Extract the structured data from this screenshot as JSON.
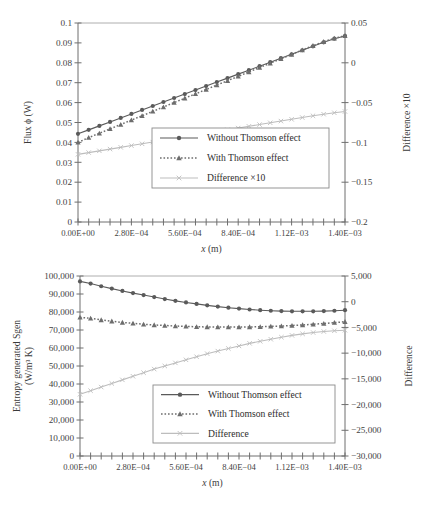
{
  "figure": {
    "background": "#ffffff",
    "colors": {
      "series_without": "#5a5a5a",
      "series_with": "#6d6d6d",
      "series_difference": "#bdbdbd",
      "axis": "#6e6e6e",
      "text": "#3a3a3a"
    }
  },
  "charts": [
    {
      "id": "chart-top",
      "chart_data": {
        "type": "line",
        "title": "",
        "xlabel": "x (m)",
        "ylabel": "Flux ϕ (W)",
        "y2label": "Difference ×10",
        "xlim": [
          0,
          0.0014
        ],
        "ylim": [
          0,
          0.1
        ],
        "y2lim": [
          -0.2,
          0.05
        ],
        "grid": false,
        "legend_position": "center",
        "xticks": [
          0,
          0.00028,
          0.00056,
          0.00084,
          0.00112,
          0.0014
        ],
        "xticklabels": [
          "0.00E+00",
          "2.80E−04",
          "5.60E−04",
          "8.40E−04",
          "1.12E−03",
          "1.40E−03"
        ],
        "xminor_count": 25,
        "yticks": [
          0,
          0.01,
          0.02,
          0.03,
          0.04,
          0.05,
          0.06,
          0.07,
          0.08,
          0.09,
          0.1
        ],
        "yticklabels": [
          "0",
          "0.01",
          "0.02",
          "0.03",
          "0.04",
          "0.05",
          "0.06",
          "0.07",
          "0.08",
          "0.09",
          "0.1"
        ],
        "y2ticks": [
          -0.2,
          -0.15,
          -0.1,
          -0.05,
          0,
          0.05
        ],
        "y2ticklabels": [
          "−0.2",
          "−0.15",
          "−0.1",
          "−0.05",
          "0",
          "0.05"
        ],
        "x": [
          0.0,
          5.6e-05,
          0.000112,
          0.000168,
          0.000224,
          0.00028,
          0.000336,
          0.000392,
          0.000448,
          0.000504,
          0.00056,
          0.000616,
          0.000672,
          0.000728,
          0.000784,
          0.00084,
          0.000896,
          0.000952,
          0.001008,
          0.001064,
          0.00112,
          0.001176,
          0.001232,
          0.001288,
          0.001344,
          0.0014
        ],
        "series": [
          {
            "name": "Without Thomson effect",
            "axis": "left",
            "marker": "circle",
            "linestyle": "solid",
            "color": "#5a5a5a",
            "values": [
              0.0443,
              0.0463,
              0.0483,
              0.0503,
              0.0523,
              0.0543,
              0.0563,
              0.0583,
              0.0603,
              0.0623,
              0.0643,
              0.0663,
              0.0683,
              0.0703,
              0.0723,
              0.0743,
              0.0763,
              0.0783,
              0.0803,
              0.0823,
              0.0843,
              0.0863,
              0.0883,
              0.0903,
              0.0921,
              0.0935
            ]
          },
          {
            "name": "With Thomson effect",
            "axis": "left",
            "marker": "triangle",
            "linestyle": "dotted",
            "color": "#6d6d6d",
            "values": [
              0.04,
              0.0424,
              0.0446,
              0.0468,
              0.049,
              0.0512,
              0.0534,
              0.0556,
              0.0578,
              0.06,
              0.0622,
              0.0644,
              0.0666,
              0.0688,
              0.071,
              0.0732,
              0.0754,
              0.0776,
              0.0798,
              0.082,
              0.0842,
              0.0864,
              0.0886,
              0.0906,
              0.0923,
              0.0936
            ]
          },
          {
            "name": "Difference ×10",
            "axis": "right",
            "marker": "cross",
            "linestyle": "solid",
            "color": "#bdbdbd",
            "values": [
              -0.115,
              -0.1128,
              -0.1106,
              -0.1084,
              -0.1062,
              -0.104,
              -0.1018,
              -0.0996,
              -0.0974,
              -0.0952,
              -0.093,
              -0.0908,
              -0.0886,
              -0.0864,
              -0.0842,
              -0.082,
              -0.0798,
              -0.0776,
              -0.0754,
              -0.0732,
              -0.071,
              -0.0688,
              -0.0666,
              -0.0646,
              -0.0628,
              -0.0612
            ]
          }
        ],
        "legend": [
          {
            "label": "Without Thomson effect",
            "marker": "circle",
            "linestyle": "solid",
            "color": "#5a5a5a"
          },
          {
            "label": "With Thomson effect",
            "marker": "triangle",
            "linestyle": "dotted",
            "color": "#6d6d6d"
          },
          {
            "label": "Difference ×10",
            "marker": "cross",
            "linestyle": "solid",
            "color": "#bdbdbd"
          }
        ]
      }
    },
    {
      "id": "chart-bottom",
      "chart_data": {
        "type": "line",
        "title": "",
        "xlabel": "x (m)",
        "ylabel": "Entropy generated Sgen",
        "ylabel2": "(W/m³ K)",
        "y2label": "Difference",
        "xlim": [
          0,
          0.0014
        ],
        "ylim": [
          0,
          100000
        ],
        "y2lim": [
          -30000,
          5000
        ],
        "grid": false,
        "legend_position": "center",
        "xticks": [
          0,
          0.00028,
          0.00056,
          0.00084,
          0.00112,
          0.0014
        ],
        "xticklabels": [
          "0.00E+00",
          "2.80E−04",
          "5.60E−04",
          "8.40E−04",
          "1.12E−03",
          "1.40E−03"
        ],
        "xminor_count": 25,
        "yticks": [
          0,
          10000,
          20000,
          30000,
          40000,
          50000,
          60000,
          70000,
          80000,
          90000,
          100000
        ],
        "yticklabels": [
          "0",
          "10,000",
          "20,000",
          "30,000",
          "40,000",
          "50,000",
          "60,000",
          "70,000",
          "80,000",
          "90,000",
          "100,000"
        ],
        "y2ticks": [
          -30000,
          -25000,
          -20000,
          -15000,
          -10000,
          -5000,
          0,
          5000
        ],
        "y2ticklabels": [
          "−30,000",
          "−25,000",
          "−20,000",
          "−15,000",
          "−10,000",
          "−5,000",
          "0",
          "5,000"
        ],
        "x": [
          0.0,
          5.6e-05,
          0.000112,
          0.000168,
          0.000224,
          0.00028,
          0.000336,
          0.000392,
          0.000448,
          0.000504,
          0.00056,
          0.000616,
          0.000672,
          0.000728,
          0.000784,
          0.00084,
          0.000896,
          0.000952,
          0.001008,
          0.001064,
          0.00112,
          0.001176,
          0.001232,
          0.001288,
          0.001344,
          0.0014
        ],
        "series": [
          {
            "name": "Without Thomson effect",
            "axis": "left",
            "marker": "circle",
            "linestyle": "solid",
            "color": "#5a5a5a",
            "values": [
              97000,
              95800,
              94300,
              93000,
              91700,
              90500,
              89400,
              88300,
              87200,
              86200,
              85300,
              84500,
              83700,
              83000,
              82400,
              81900,
              81400,
              81000,
              80700,
              80500,
              80400,
              80400,
              80400,
              80500,
              80700,
              81000
            ]
          },
          {
            "name": "With Thomson effect",
            "axis": "left",
            "marker": "triangle",
            "linestyle": "dotted",
            "color": "#6d6d6d",
            "values": [
              77000,
              76500,
              75600,
              74900,
              74200,
              73700,
              73200,
              72800,
              72500,
              72200,
              72000,
              71800,
              71700,
              71600,
              71600,
              71600,
              71700,
              71800,
              72000,
              72200,
              72500,
              72800,
              73200,
              73600,
              74100,
              74600
            ]
          },
          {
            "name": "Difference",
            "axis": "right",
            "marker": "cross",
            "linestyle": "solid",
            "color": "#bdbdbd",
            "values": [
              -18000,
              -17300,
              -16600,
              -15900,
              -15200,
              -14500,
              -13800,
              -13100,
              -12500,
              -11900,
              -11300,
              -10700,
              -10100,
              -9600,
              -9100,
              -8600,
              -8100,
              -7700,
              -7300,
              -6900,
              -6550,
              -6250,
              -6000,
              -5800,
              -5650,
              -5550
            ]
          }
        ],
        "legend": [
          {
            "label": "Without Thomson effect",
            "marker": "circle",
            "linestyle": "solid",
            "color": "#5a5a5a"
          },
          {
            "label": "With Thomson effect",
            "marker": "triangle",
            "linestyle": "dotted",
            "color": "#6d6d6d"
          },
          {
            "label": "Difference",
            "marker": "cross",
            "linestyle": "solid",
            "color": "#bdbdbd"
          }
        ]
      }
    }
  ]
}
